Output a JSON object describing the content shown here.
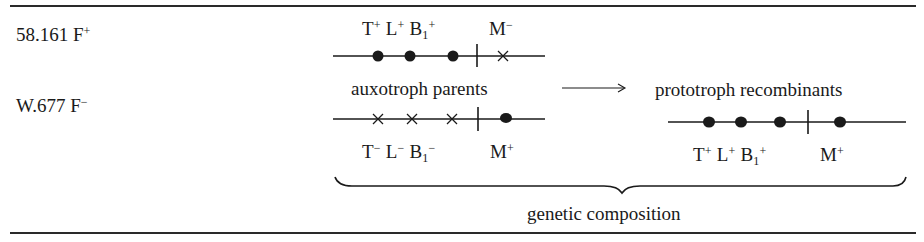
{
  "strains": [
    {
      "name": "58.161",
      "fertility": "F",
      "sign": "+"
    },
    {
      "name": "W.677",
      "fertility": "F",
      "sign": "−"
    }
  ],
  "parent1": {
    "genes": [
      {
        "g": "T",
        "sub": "",
        "sign": "+"
      },
      {
        "g": "L",
        "sub": "",
        "sign": "+"
      },
      {
        "g": "B",
        "sub": "1",
        "sign": "+"
      },
      {
        "g": "M",
        "sub": "",
        "sign": "−"
      }
    ],
    "markers": [
      "dot",
      "dot",
      "dot",
      "centromere",
      "cross"
    ]
  },
  "parent2": {
    "genes": [
      {
        "g": "T",
        "sub": "",
        "sign": "−"
      },
      {
        "g": "L",
        "sub": "",
        "sign": "−"
      },
      {
        "g": "B",
        "sub": "1",
        "sign": "−"
      },
      {
        "g": "M",
        "sub": "",
        "sign": "+"
      }
    ],
    "markers": [
      "cross",
      "cross",
      "cross",
      "centromere",
      "dot"
    ]
  },
  "recombinant": {
    "genes": [
      {
        "g": "T",
        "sub": "",
        "sign": "+"
      },
      {
        "g": "L",
        "sub": "",
        "sign": "+"
      },
      {
        "g": "B",
        "sub": "1",
        "sign": "+"
      },
      {
        "g": "M",
        "sub": "",
        "sign": "+"
      }
    ],
    "markers": [
      "dot",
      "dot",
      "dot",
      "centromere",
      "dot"
    ]
  },
  "labels": {
    "parents": "auxotroph parents",
    "recombinants": "prototroph recombinants",
    "composition": "genetic composition",
    "arrow": "→"
  },
  "colors": {
    "ink": "#1a1a1a",
    "background": "#ffffff"
  }
}
